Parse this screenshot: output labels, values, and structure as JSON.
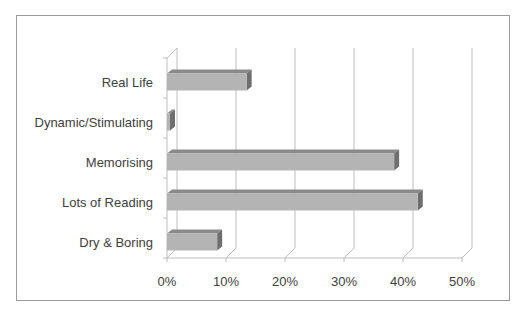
{
  "chart_data": {
    "type": "bar",
    "orientation": "horizontal",
    "style": "3d-clustered-bar",
    "title": "",
    "xlabel": "",
    "ylabel": "",
    "categories": [
      "Real Life",
      "Dynamic/Stimulating",
      "Memorising",
      "Lots of Reading",
      "Dry & Boring"
    ],
    "values": [
      13.5,
      0.5,
      38.5,
      42.5,
      8.5
    ],
    "value_unit": "%",
    "xlim": [
      0,
      50
    ],
    "xticks": [
      "0%",
      "10%",
      "20%",
      "30%",
      "40%",
      "50%"
    ],
    "grid": {
      "vertical": true,
      "horizontal": false
    },
    "legend": null,
    "colors": {
      "bar_front": "#b4b4b4",
      "bar_top": "#8a8a8a",
      "bar_side": "#6e6e6e",
      "gridline": "#bdbdbd",
      "border": "#9a9a9a",
      "text": "#404040"
    }
  }
}
